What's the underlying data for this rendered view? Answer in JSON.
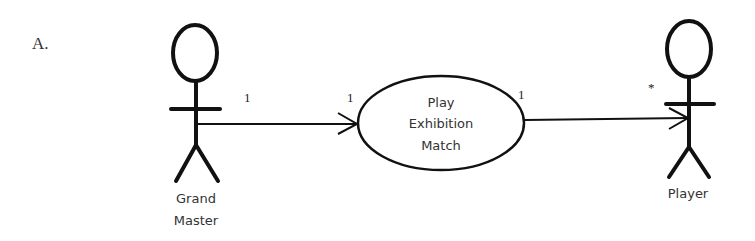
{
  "figure_label": "A.",
  "actors": [
    {
      "id": "grand-master",
      "name_lines": [
        "Grand",
        "Master"
      ]
    },
    {
      "id": "player",
      "name_lines": [
        "Player"
      ]
    }
  ],
  "use_case": {
    "name_lines": [
      "Play",
      "Exhibition",
      "Match"
    ]
  },
  "associations": [
    {
      "from": "grand-master",
      "to": "use_case",
      "from_multiplicity": "1",
      "to_multiplicity": "1"
    },
    {
      "from": "use_case",
      "to": "player",
      "from_multiplicity": "1",
      "to_multiplicity": "*"
    }
  ],
  "colors": {
    "stroke": "#111111",
    "text": "#333333",
    "background": "#ffffff"
  }
}
